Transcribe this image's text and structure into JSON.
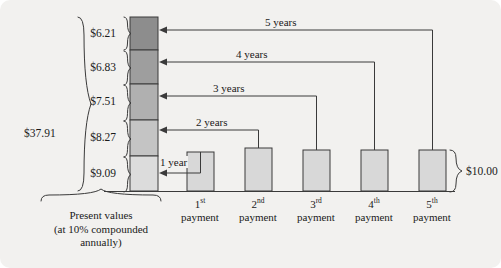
{
  "figure": {
    "background_color": "#f2f1ef",
    "line_color": "#3a3a3a"
  },
  "present_value_stack": {
    "total_label": "$37.91",
    "caption_line1": "Present values",
    "caption_line2": "(at 10% compounded",
    "caption_line3": "annually)",
    "segments": [
      {
        "amount": "$6.21",
        "fill": "#8d8d8d",
        "years_label": "5 years",
        "order_from_top": 1
      },
      {
        "amount": "$6.83",
        "fill": "#9e9e9e",
        "years_label": "4 years",
        "order_from_top": 2
      },
      {
        "amount": "$7.51",
        "fill": "#b0b0b0",
        "years_label": "3 years",
        "order_from_top": 3
      },
      {
        "amount": "$8.27",
        "fill": "#c4c4c4",
        "years_label": "2 years",
        "order_from_top": 4
      },
      {
        "amount": "$9.09",
        "fill": "#dcdcdc",
        "years_label": "1 year",
        "order_from_top": 5
      }
    ]
  },
  "year_labels": {
    "y5": "5 years",
    "y4": "4 years",
    "y3": "3 years",
    "y2": "2 years",
    "y1": "1 year"
  },
  "payments": {
    "amount_label": "$10.00",
    "bar_fill": "#d8d8d8",
    "items": [
      {
        "ordinal": "1",
        "suffix": "st",
        "word": "payment"
      },
      {
        "ordinal": "2",
        "suffix": "nd",
        "word": "payment"
      },
      {
        "ordinal": "3",
        "suffix": "rd",
        "word": "payment"
      },
      {
        "ordinal": "4",
        "suffix": "th",
        "word": "payment"
      },
      {
        "ordinal": "5",
        "suffix": "th",
        "word": "payment"
      }
    ]
  }
}
